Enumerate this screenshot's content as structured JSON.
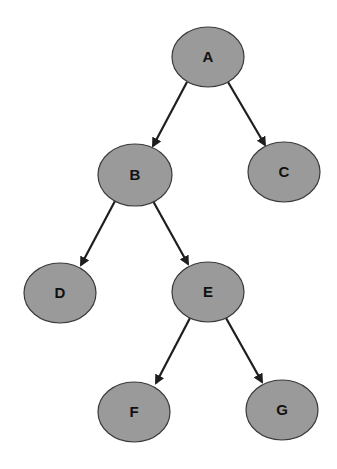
{
  "diagram": {
    "type": "binary-tree",
    "colors": {
      "background": "#ffffff",
      "node_fill": "#9a9a9a",
      "node_stroke": "#3a3a3a",
      "edge": "#1e1e1e",
      "label": "#111111"
    },
    "nodes": [
      {
        "id": "A",
        "label": "A",
        "cx": 208,
        "cy": 57,
        "rx": 36,
        "ry": 30
      },
      {
        "id": "B",
        "label": "B",
        "cx": 135,
        "cy": 175,
        "rx": 37,
        "ry": 31
      },
      {
        "id": "C",
        "label": "C",
        "cx": 284,
        "cy": 172,
        "rx": 36,
        "ry": 30
      },
      {
        "id": "D",
        "label": "D",
        "cx": 60,
        "cy": 293,
        "rx": 36,
        "ry": 30
      },
      {
        "id": "E",
        "label": "E",
        "cx": 208,
        "cy": 292,
        "rx": 36,
        "ry": 30
      },
      {
        "id": "F",
        "label": "F",
        "cx": 134,
        "cy": 412,
        "rx": 36,
        "ry": 30
      },
      {
        "id": "G",
        "label": "G",
        "cx": 282,
        "cy": 410,
        "rx": 36,
        "ry": 30
      }
    ],
    "edges": [
      {
        "from": "A",
        "to": "B",
        "x1": 187,
        "y1": 82,
        "x2": 153,
        "y2": 146
      },
      {
        "from": "A",
        "to": "C",
        "x1": 228,
        "y1": 82,
        "x2": 265,
        "y2": 145
      },
      {
        "from": "B",
        "to": "D",
        "x1": 115,
        "y1": 201,
        "x2": 81,
        "y2": 265
      },
      {
        "from": "B",
        "to": "E",
        "x1": 153,
        "y1": 201,
        "x2": 188,
        "y2": 264
      },
      {
        "from": "E",
        "to": "F",
        "x1": 190,
        "y1": 318,
        "x2": 156,
        "y2": 383
      },
      {
        "from": "E",
        "to": "G",
        "x1": 226,
        "y1": 318,
        "x2": 262,
        "y2": 382
      }
    ]
  }
}
